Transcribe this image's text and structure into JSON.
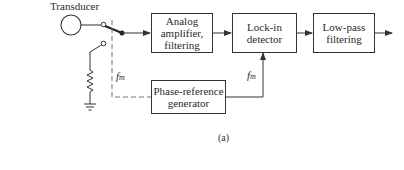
{
  "diagram": {
    "title_label": "Transducer",
    "caption": "(a)",
    "blocks": {
      "analog": {
        "lines": [
          "Analog",
          "amplifier,",
          "filtering"
        ]
      },
      "lockin": {
        "lines": [
          "Lock-in",
          "detector"
        ]
      },
      "lowpass": {
        "lines": [
          "Low-pass",
          "filtering"
        ]
      },
      "phase_ref": {
        "lines": [
          "Phase-reference",
          "generator"
        ]
      }
    },
    "labels": {
      "fm_left": {
        "main": "f",
        "sub": "m"
      },
      "fm_right": {
        "main": "f",
        "sub": "m"
      }
    },
    "components": [
      "transducer-circle",
      "switch",
      "resistor",
      "ground"
    ],
    "colors": {
      "line": "#333333",
      "dashed": "#777777",
      "background": "#ffffff"
    }
  }
}
